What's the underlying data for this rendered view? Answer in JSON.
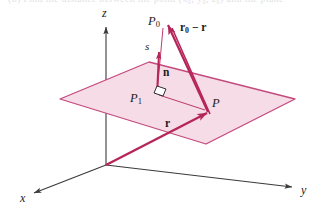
{
  "figure": {
    "caption_cut": "(b)  Find the distance between the point  (x₀, y₀, z₀)  and the plane",
    "background_color": "#ffffff"
  },
  "colors": {
    "plane_fill": "#f6dce7",
    "plane_stroke": "#c3497e",
    "vector_stroke": "#b5255a",
    "thin_line": "#b5255a",
    "axis_stroke": "#3a3a3a",
    "label_color": "#1b1b1b",
    "right_angle_stroke": "#1b1b1b"
  },
  "axes": {
    "x": {
      "label": "x",
      "x": 22,
      "y": 199
    },
    "y": {
      "label": "y",
      "x": 303,
      "y": 192
    },
    "z": {
      "label": "z",
      "x": 103,
      "y": 13
    }
  },
  "points": [
    {
      "name": "P0",
      "label": "P",
      "sub": "0",
      "x": 154,
      "y": 22
    },
    {
      "name": "P1",
      "label": "P",
      "sub": "1",
      "x": 136,
      "y": 99
    },
    {
      "name": "P",
      "label": "P",
      "sub": "",
      "x": 211,
      "y": 103
    }
  ],
  "vectors": [
    {
      "name": "r0-minus-r",
      "label": "r",
      "sub": "0",
      "rest": " − r",
      "x": 180,
      "y": 28
    },
    {
      "name": "r",
      "label": "r",
      "sub": "",
      "rest": "",
      "x": 167,
      "y": 124
    },
    {
      "name": "n",
      "label": "n",
      "sub": "",
      "rest": "",
      "x": 165,
      "y": 73
    }
  ],
  "segments": [
    {
      "name": "distance-s",
      "label": "s",
      "x": 147,
      "y": 47
    }
  ],
  "markers": {
    "right_angle": {
      "name": "right-angle-marker",
      "x": 159,
      "y": 88
    }
  }
}
